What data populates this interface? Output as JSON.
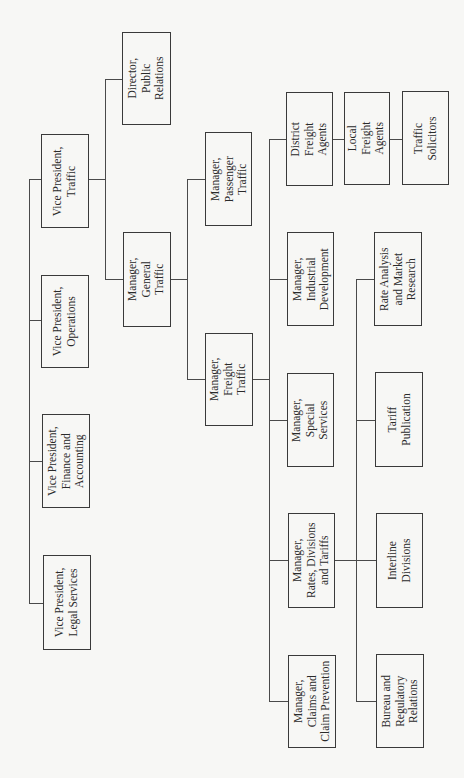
{
  "chart": {
    "type": "org-chart",
    "orientation": "rotated-90-ccw",
    "nodes": {
      "vp_traffic": "Vice President,\nTraffic",
      "vp_operations": "Vice President,\nOperations",
      "vp_finance": "Vice President,\nFinance and\nAccounting",
      "vp_legal": "Vice President,\nLegal Services",
      "dir_public_relations": "Director,\nPublic\nRelations",
      "mgr_general_traffic": "Manager,\nGeneral\nTraffic",
      "mgr_passenger_traffic": "Manager,\nPassenger\nTraffic",
      "mgr_freight_traffic": "Manager,\nFreight\nTraffic",
      "district_freight_agents": "District\nFreight\nAgents",
      "local_freight_agents": "Local\nFreight\nAgents",
      "traffic_solicitors": "Traffic\nSolicitors",
      "mgr_industrial_development": "Manager,\nIndustrial\nDevelopment",
      "mgr_special_services": "Manager,\nSpecial\nServices",
      "mgr_rates_divisions_tariffs": "Manager,\nRates, Divisions\nand Tariffs",
      "mgr_claims": "Manager,\nClaims and\nClaim Prevention",
      "rate_analysis": "Rate Analysis\nand Market\nResearch",
      "tariff_publication": "Tariff\nPublication",
      "interline_divisions": "Interline\nDivisions",
      "bureau_regulatory": "Bureau and\nRegulatory\nRelations"
    },
    "hierarchy": [
      {
        "parent": null,
        "children": [
          "vp_traffic",
          "vp_operations",
          "vp_finance",
          "vp_legal"
        ]
      },
      {
        "parent": "vp_traffic",
        "children": [
          "dir_public_relations",
          "mgr_general_traffic"
        ]
      },
      {
        "parent": "mgr_general_traffic",
        "children": [
          "mgr_passenger_traffic",
          "mgr_freight_traffic"
        ]
      },
      {
        "parent": "mgr_freight_traffic",
        "children": [
          "district_freight_agents",
          "mgr_industrial_development",
          "mgr_special_services",
          "mgr_rates_divisions_tariffs",
          "mgr_claims"
        ]
      },
      {
        "parent": "district_freight_agents",
        "children": [
          "local_freight_agents"
        ]
      },
      {
        "parent": "local_freight_agents",
        "children": [
          "traffic_solicitors"
        ]
      },
      {
        "parent": "mgr_rates_divisions_tariffs",
        "children": [
          "rate_analysis",
          "tariff_publication",
          "interline_divisions",
          "bureau_regulatory"
        ]
      }
    ]
  }
}
